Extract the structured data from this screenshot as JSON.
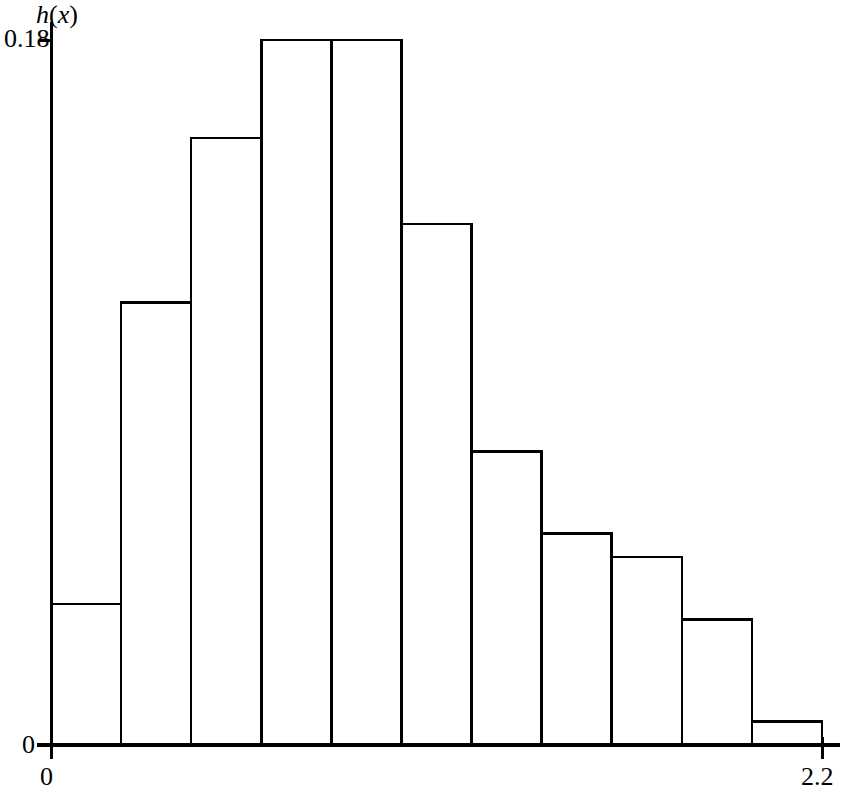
{
  "figure": {
    "width": 843,
    "height": 802,
    "background_color": "#ffffff",
    "line_color": "#000000"
  },
  "axes": {
    "y_axis_label": "h(x)",
    "y_axis_label_h": "h",
    "y_axis_label_open": "(",
    "y_axis_label_x": "x",
    "y_axis_label_close": ")",
    "x_axis_label": "x",
    "y_tick_top": "0.18",
    "y_tick_zero": "0",
    "x_tick_zero": "0",
    "x_tick_max": "2.2"
  },
  "chart_data": {
    "type": "bar",
    "title": "",
    "xlabel": "x",
    "ylabel": "h(x)",
    "xlim": [
      0,
      2.2
    ],
    "ylim": [
      0,
      0.18
    ],
    "grid": false,
    "legend": null,
    "bin_width": 0.2,
    "bin_edges": [
      0,
      0.2,
      0.4,
      0.6,
      0.8,
      1.0,
      1.2,
      1.4,
      1.6,
      1.8,
      2.0,
      2.2
    ],
    "categories": [
      "0.0-0.2",
      "0.2-0.4",
      "0.4-0.6",
      "0.6-0.8",
      "0.8-1.0",
      "1.0-1.2",
      "1.2-1.4",
      "1.4-1.6",
      "1.6-1.8",
      "1.8-2.0",
      "2.0-2.2"
    ],
    "xtick_labels": [
      "0",
      "2.2"
    ],
    "ytick_labels": [
      "0",
      "0.18"
    ],
    "values": [
      0.036,
      0.113,
      0.155,
      0.18,
      0.18,
      0.133,
      0.075,
      0.054,
      0.048,
      0.032,
      0.006
    ],
    "bar_fill": "none",
    "bar_edge_color": "#000000"
  },
  "geometry": {
    "plot_left": 51,
    "plot_baseline": 745,
    "plot_top": 40,
    "plot_right": 822,
    "axis_overhang_right": 18,
    "axis_overhang_top": 18
  }
}
